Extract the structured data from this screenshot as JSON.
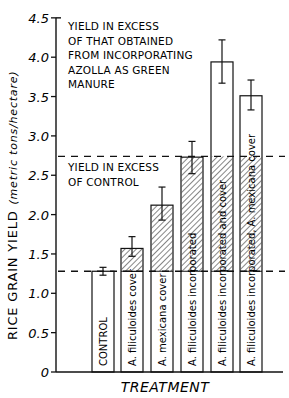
{
  "chart_data": {
    "type": "bar",
    "title": "",
    "xlabel": "TREATMENT",
    "ylabel": "RICE GRAIN YIELD",
    "ylabel_units": "(metric tons/hectare)",
    "ylim": [
      0,
      4.5
    ],
    "yticks": [
      0,
      0.5,
      1.0,
      1.5,
      2.0,
      2.5,
      3.0,
      3.5,
      4.0,
      4.5
    ],
    "ytick_labels": [
      "0",
      "0.5",
      "1.0",
      "1.5",
      "2.0",
      "2.5",
      "3.0",
      "3.5",
      "4.0",
      "4.5"
    ],
    "categories": [
      "CONTROL",
      "A. filiculoides cover",
      "A. mexicana cover",
      "A. filiculoides incorporated",
      "A. filiculoides incorporated and cover",
      "A. filiculoides incorporated, A. mexicana cover"
    ],
    "values": [
      1.28,
      1.57,
      2.12,
      2.73,
      3.94,
      3.51
    ],
    "error_low": [
      1.23,
      1.47,
      1.93,
      2.52,
      3.67,
      3.33
    ],
    "error_high": [
      1.33,
      1.72,
      2.35,
      2.93,
      4.22,
      3.71
    ],
    "reference_lines": [
      {
        "name": "control level",
        "value": 1.28,
        "style": "dashed"
      },
      {
        "name": "incorporated level",
        "value": 2.74,
        "style": "dashed"
      }
    ],
    "annotations": [
      {
        "text_lines": [
          "YIELD IN EXCESS",
          "OF THAT OBTAINED",
          "FROM INCORPORATING",
          "AZOLLA AS GREEN",
          "MANURE"
        ],
        "region": "above 2.74 line"
      },
      {
        "text_lines": [
          "YIELD IN EXCESS",
          "OF CONTROL"
        ],
        "region": "between 1.28 and 2.74 lines"
      }
    ],
    "hatching": "diagonal hatch marks yield in excess of control (between 1.28 and 2.74 lines)",
    "grid": false,
    "legend": null
  }
}
